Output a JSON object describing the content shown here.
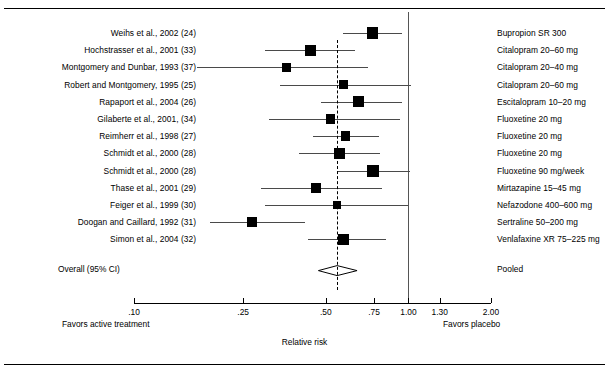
{
  "figure": {
    "axis_title": "Relative risk",
    "left_note": "Favors active treatment",
    "right_note": "Favors placebo",
    "overall_label": "Overall (95% CI)",
    "overall_right_label": "Pooled"
  },
  "chart_data": {
    "type": "forest",
    "title": "",
    "xlabel": "Relative risk",
    "scale": "log",
    "xlim": [
      0.1,
      2.0
    ],
    "ticks": [
      {
        "value": 0.1,
        "label": ".10"
      },
      {
        "value": 0.25,
        "label": ".25"
      },
      {
        "value": 0.5,
        "label": ".50"
      },
      {
        "value": 0.75,
        "label": ".75"
      },
      {
        "value": 1.0,
        "label": "1.00"
      },
      {
        "value": 1.3,
        "label": "1.30"
      },
      {
        "value": 2.0,
        "label": "2.00"
      }
    ],
    "null_line": 1.0,
    "pooled_line": 0.55,
    "grid": false,
    "legend": "none",
    "left_note": "Favors active treatment",
    "right_note": "Favors placebo",
    "studies": [
      {
        "label": "Weihs et al., 2002 (24)",
        "drug": "Bupropion SR 300",
        "rr": 0.74,
        "lcl": 0.58,
        "ucl": 0.95,
        "weight": 10.5
      },
      {
        "label": "Hochstrasser et al., 2001 (33)",
        "drug": "Citalopram 20–60 mg",
        "rr": 0.44,
        "lcl": 0.3,
        "ucl": 0.64,
        "weight": 9.5
      },
      {
        "label": "Montgomery and Dunbar, 1993 (37)",
        "drug": "Citalopram 20–40 mg",
        "rr": 0.36,
        "lcl": 0.17,
        "ucl": 0.71,
        "weight": 6.5
      },
      {
        "label": "Robert and Montgomery, 1995 (25)",
        "drug": "Citalopram 20–60 mg",
        "rr": 0.58,
        "lcl": 0.34,
        "ucl": 1.02,
        "weight": 7.0
      },
      {
        "label": "Rapaport et al., 2004 (26)",
        "drug": "Escitalopram 10–20 mg",
        "rr": 0.66,
        "lcl": 0.48,
        "ucl": 0.95,
        "weight": 9.0
      },
      {
        "label": "Gilaberte et al., 2001, (34)",
        "drug": "Fluoxetine 20 mg",
        "rr": 0.52,
        "lcl": 0.31,
        "ucl": 0.93,
        "weight": 6.0
      },
      {
        "label": "Reimherr et al., 1998 (27)",
        "drug": "Fluoxetine 20 mg",
        "rr": 0.59,
        "lcl": 0.45,
        "ucl": 0.78,
        "weight": 7.5
      },
      {
        "label": "Schmidt et al., 2000 (28)",
        "drug": "Fluoxetine 20 mg",
        "rr": 0.56,
        "lcl": 0.4,
        "ucl": 0.79,
        "weight": 8.5
      },
      {
        "label": "Schmidt et al., 2000 (28)",
        "drug": "Fluoxetine 90 mg/week",
        "rr": 0.74,
        "lcl": 0.55,
        "ucl": 1.01,
        "weight": 11.0
      },
      {
        "label": "Thase et al., 2001 (29)",
        "drug": "Mirtazapine 15–45 mg",
        "rr": 0.46,
        "lcl": 0.29,
        "ucl": 0.8,
        "weight": 7.0
      },
      {
        "label": "Feiger et al., 1999 (30)",
        "drug": "Nefazodone 400–600 mg",
        "rr": 0.55,
        "lcl": 0.3,
        "ucl": 1.0,
        "weight": 5.0
      },
      {
        "label": "Doogan and Caillard, 1992 (31)",
        "drug": "Sertraline 50–200 mg",
        "rr": 0.27,
        "lcl": 0.19,
        "ucl": 0.42,
        "weight": 8.0
      },
      {
        "label": "Simon et al., 2004 (32)",
        "drug": "Venlafaxine XR 75–225 mg",
        "rr": 0.58,
        "lcl": 0.43,
        "ucl": 0.83,
        "weight": 9.0
      }
    ],
    "overall": {
      "label": "Overall (95% CI)",
      "drug": "Pooled",
      "rr": 0.55,
      "lcl": 0.47,
      "ucl": 0.65
    }
  }
}
